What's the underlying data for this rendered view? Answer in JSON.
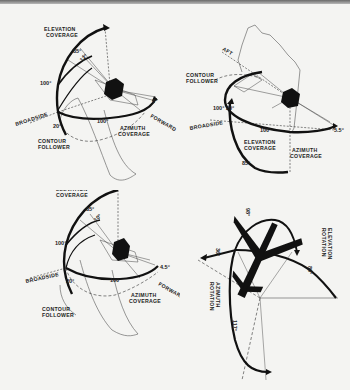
{
  "figure": {
    "type": "antenna-coverage-diagrams",
    "panels": [
      {
        "id": "top-left",
        "labels": {
          "elevation_coverage_1": "ELEVATION",
          "elevation_coverage_2": "COVERAGE",
          "azimuth_coverage_1": "AZIMUTH",
          "azimuth_coverage_2": "COVERAGE",
          "contour_follower_1": "CONTOUR",
          "contour_follower_2": "FOLLOWER",
          "broadside": "BROADSIDE",
          "forward": "FORWARD"
        },
        "angles": [
          "85°",
          "12°",
          "100°",
          "100°",
          "20°",
          "6°"
        ]
      },
      {
        "id": "top-right",
        "labels": {
          "aft": "AFT",
          "contour_follower_1": "CONTOUR",
          "contour_follower_2": "FOLLOWER",
          "broadside": "BROADSIDE",
          "elevation_coverage_1": "ELEVATION",
          "elevation_coverage_2": "COVERAGE",
          "azimuth_coverage_1": "AZIMUTH",
          "azimuth_coverage_2": "COVERAGE"
        },
        "angles": [
          "100°",
          "20°",
          "100°",
          "5.5°",
          "85°"
        ]
      },
      {
        "id": "bottom-left",
        "labels": {
          "elevation_coverage_1": "ELEVATION",
          "elevation_coverage_2": "COVERAGE",
          "azimuth_coverage_1": "AZIMUTH",
          "azimuth_coverage_2": "COVERAGE",
          "contour_follower_1": "CONTOUR",
          "contour_follower_2": "FOLLOWER",
          "broadside": "BROADSIDE",
          "forward": "FORWARD"
        },
        "angles": [
          "85°",
          "10°",
          "100°",
          "100°",
          "20°",
          "4.5°"
        ]
      },
      {
        "id": "bottom-right",
        "labels": {
          "elevation_rotation_1": "ELEVATION",
          "elevation_rotation_2": "ROTATION",
          "azimuth_rotation_1": "AZIMUTH",
          "azimuth_rotation_2": "ROTATION"
        },
        "angles": [
          "98°",
          "36°",
          "80°",
          "117°"
        ]
      }
    ]
  }
}
